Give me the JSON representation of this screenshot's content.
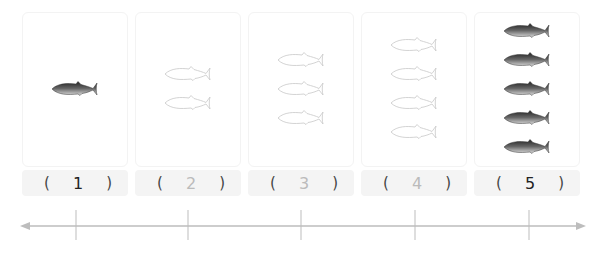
{
  "colors": {
    "line": "#bdbdbd",
    "card_border": "#f3f3f3",
    "label_bg": "#f4f4f4",
    "filled_fish": "#4a4a4a",
    "outline_fish": "#c8c8c8"
  },
  "cards": [
    {
      "count": 1,
      "style": "filled",
      "label": "1",
      "label_color": "#222222",
      "fish_icon": "filled-fish-icon"
    },
    {
      "count": 2,
      "style": "outline",
      "label": "2",
      "label_color": "#bbbbbb",
      "fish_icon": "outline-fish-icon"
    },
    {
      "count": 3,
      "style": "outline",
      "label": "3",
      "label_color": "#bbbbbb",
      "fish_icon": "outline-fish-icon"
    },
    {
      "count": 4,
      "style": "outline",
      "label": "4",
      "label_color": "#bbbbbb",
      "fish_icon": "outline-fish-icon"
    },
    {
      "count": 5,
      "style": "filled",
      "label": "5",
      "label_color": "#222222",
      "fish_icon": "filled-fish-icon"
    }
  ],
  "label_parens": {
    "open": "(",
    "close": ")"
  },
  "number_line": {
    "ticks": 5,
    "arrows": "both"
  }
}
